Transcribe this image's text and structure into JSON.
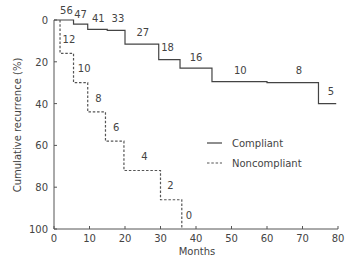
{
  "chart_data": {
    "type": "line",
    "subtype": "step (Kaplan-Meier style cumulative incidence)",
    "title": "",
    "xlabel": "Months",
    "ylabel": "Cumulative recurrence (%)",
    "xlim": [
      0,
      80
    ],
    "ylim": [
      0,
      100
    ],
    "y_inverted": true,
    "x_ticks": [
      0,
      10,
      20,
      30,
      40,
      50,
      60,
      70,
      80
    ],
    "y_ticks": [
      0,
      20,
      40,
      60,
      80,
      100
    ],
    "grid": false,
    "legend_position": "center-right",
    "series": [
      {
        "name": "Compliant",
        "style": "solid",
        "steps": [
          {
            "x": 0,
            "y": 0
          },
          {
            "x": 5.5,
            "y": 2
          },
          {
            "x": 9.5,
            "y": 4.5
          },
          {
            "x": 15,
            "y": 5
          },
          {
            "x": 20,
            "y": 11.5
          },
          {
            "x": 29.5,
            "y": 19
          },
          {
            "x": 35.5,
            "y": 23
          },
          {
            "x": 44.5,
            "y": 29.5
          },
          {
            "x": 60,
            "y": 30
          },
          {
            "x": 74.5,
            "y": 40
          }
        ],
        "end_x": 79.5,
        "at_risk_labels": [
          {
            "x": 3.5,
            "y": -3,
            "text": "56"
          },
          {
            "x": 7.5,
            "y": -1,
            "text": "47"
          },
          {
            "x": 12.5,
            "y": 1,
            "text": "41"
          },
          {
            "x": 18,
            "y": 1,
            "text": "33"
          },
          {
            "x": 25,
            "y": 7.5,
            "text": "27"
          },
          {
            "x": 32,
            "y": 15,
            "text": "18"
          },
          {
            "x": 40,
            "y": 19.5,
            "text": "16"
          },
          {
            "x": 52.5,
            "y": 26,
            "text": "10"
          },
          {
            "x": 69,
            "y": 26,
            "text": "8"
          },
          {
            "x": 78,
            "y": 36,
            "text": "5"
          }
        ]
      },
      {
        "name": "Noncompliant",
        "style": "dashed",
        "steps": [
          {
            "x": 0,
            "y": 0
          },
          {
            "x": 1.7,
            "y": 16
          },
          {
            "x": 5.5,
            "y": 30
          },
          {
            "x": 9.5,
            "y": 44
          },
          {
            "x": 14.5,
            "y": 58
          },
          {
            "x": 19.7,
            "y": 72
          },
          {
            "x": 30,
            "y": 86
          },
          {
            "x": 36,
            "y": 100
          }
        ],
        "start_x": 1.7,
        "end_x": 36,
        "at_risk_labels": [
          {
            "x": 4.2,
            "y": 11,
            "text": "12"
          },
          {
            "x": 8.5,
            "y": 25,
            "text": "10"
          },
          {
            "x": 12.5,
            "y": 39,
            "text": "8"
          },
          {
            "x": 17.5,
            "y": 53,
            "text": "6"
          },
          {
            "x": 25.5,
            "y": 67,
            "text": "4"
          },
          {
            "x": 32.8,
            "y": 81,
            "text": "2"
          },
          {
            "x": 38,
            "y": 95,
            "text": "0"
          }
        ]
      }
    ],
    "legend": [
      {
        "label": "Compliant",
        "style": "solid"
      },
      {
        "label": "Noncompliant",
        "style": "dashed"
      }
    ]
  },
  "colors": {
    "axis": "#555555",
    "line": "#444444",
    "text": "#444444",
    "background": "#ffffff"
  }
}
